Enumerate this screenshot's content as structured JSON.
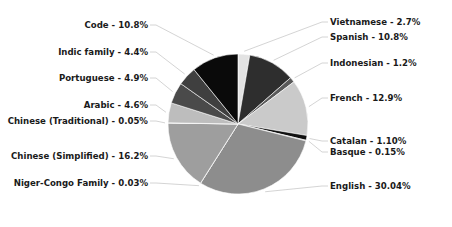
{
  "chart_data": {
    "type": "pie",
    "title": "",
    "grid": false,
    "legend_position": "callout-labels",
    "palette": [
      "#e8e8e8",
      "#5f5f5f",
      "#2b2b2b",
      "#cfcfcf",
      "#9a9a9a",
      "#0d0d0d",
      "#c2c2c2",
      "#8a8a8a",
      "#3d3d3d",
      "#b5b5b5",
      "#6e6e6e",
      "#1f1f1f",
      "#0a0a0a"
    ],
    "start_angle_deg": -90,
    "direction": "clockwise",
    "categories": [
      "Vietnamese",
      "Spanish",
      "Indonesian",
      "French",
      "Catalan",
      "Basque",
      "English",
      "Niger-Congo Family",
      "Chinese (Simplified)",
      "Chinese (Traditional)",
      "Arabic",
      "Portuguese",
      "Indic family",
      "Code"
    ],
    "values": [
      2.7,
      10.8,
      1.2,
      12.9,
      1.1,
      0.15,
      30.04,
      0.03,
      16.2,
      0.05,
      4.6,
      4.9,
      4.4,
      10.8
    ],
    "value_suffix": "%",
    "slices": [
      {
        "label": "Vietnamese - 2.7%",
        "name": "Vietnamese",
        "value": 2.7,
        "color": "#e3e3e3"
      },
      {
        "label": "Spanish - 10.8%",
        "name": "Spanish",
        "value": 10.8,
        "color": "#2e2e2e"
      },
      {
        "label": "Indonesian - 1.2%",
        "name": "Indonesian",
        "value": 1.2,
        "color": "#5a5a5a"
      },
      {
        "label": "French - 12.9%",
        "name": "French",
        "value": 12.9,
        "color": "#cacaca"
      },
      {
        "label": "Catalan - 1.10%",
        "name": "Catalan",
        "value": 1.1,
        "color": "#111111"
      },
      {
        "label": "Basque - 0.15%",
        "name": "Basque",
        "value": 0.15,
        "color": "#6b6b6b"
      },
      {
        "label": "English - 30.04%",
        "name": "English",
        "value": 30.04,
        "color": "#8d8d8d"
      },
      {
        "label": "Niger-Congo Family - 0.03%",
        "name": "Niger-Congo Family",
        "value": 0.03,
        "color": "#3a3a3a"
      },
      {
        "label": "Chinese (Simplified) - 16.2%",
        "name": "Chinese (Simplified)",
        "value": 16.2,
        "color": "#9e9e9e"
      },
      {
        "label": "Chinese (Traditional) - 0.05%",
        "name": "Chinese (Traditional)",
        "value": 0.05,
        "color": "#d2d2d2"
      },
      {
        "label": "Arabic - 4.6%",
        "name": "Arabic",
        "value": 4.6,
        "color": "#bdbdbd"
      },
      {
        "label": "Portuguese - 4.9%",
        "name": "Portuguese",
        "value": 4.9,
        "color": "#4a4a4a"
      },
      {
        "label": "Indic family - 4.4%",
        "name": "Indic family",
        "value": 4.4,
        "color": "#3f3f3f"
      },
      {
        "label": "Code - 10.8%",
        "name": "Code",
        "value": 10.8,
        "color": "#0a0a0a"
      }
    ],
    "labels_left": [
      "Code - 10.8%",
      "Indic family - 4.4%",
      "Portuguese - 4.9%",
      "Arabic - 4.6%",
      "Chinese (Traditional) - 0.05%",
      "Chinese (Simplified) - 16.2%",
      "Niger-Congo Family - 0.03%"
    ],
    "labels_right": [
      "Vietnamese - 2.7%",
      "Spanish - 10.8%",
      "Indonesian - 1.2%",
      "French - 12.9%",
      "Catalan - 1.10%",
      "Basque - 0.15%",
      "English - 30.04%"
    ]
  },
  "geometry": {
    "center_x": 238,
    "center_y": 124,
    "radius": 70
  }
}
